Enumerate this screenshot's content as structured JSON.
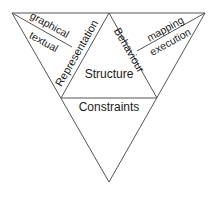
{
  "diagram": {
    "labels": {
      "structure": "Structure",
      "constraints": "Constraints",
      "representation": "Representation",
      "behaviour": "Behaviour",
      "graphical": "graphical",
      "textual": "textual",
      "mapping": "mapping",
      "execution": "execution"
    },
    "colors": {
      "line": "#555555",
      "text": "#1a1a1a",
      "background": "#ffffff"
    }
  }
}
